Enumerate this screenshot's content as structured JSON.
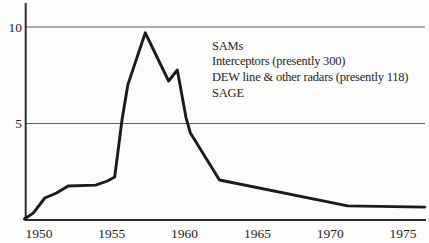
{
  "page": {
    "background": "#fcfcfa",
    "ink": "#1b1b1b",
    "grid_color": "#5f5f5f",
    "axis_color": "#2e2e2e"
  },
  "chart_data": {
    "type": "line",
    "title": "",
    "xlabel": "",
    "ylabel": "",
    "xlim": [
      1949.0,
      1976.5
    ],
    "ylim": [
      0,
      10.8
    ],
    "xticks": [
      "1950",
      "1955",
      "1960",
      "1965",
      "1970",
      "1975"
    ],
    "xtick_values": [
      1950,
      1955,
      1960,
      1965,
      1970,
      1975
    ],
    "yticks": [
      "5",
      "10"
    ],
    "ytick_values": [
      5,
      10
    ],
    "grid": "horizontal-at-yticks",
    "legend_position": "upper-right-annotation-block",
    "series": [
      {
        "name": "air-defense-systems-curve",
        "points": [
          [
            1949.0,
            0.05
          ],
          [
            1949.6,
            0.36
          ],
          [
            1950.4,
            1.14
          ],
          [
            1951.2,
            1.4
          ],
          [
            1952.0,
            1.76
          ],
          [
            1953.9,
            1.81
          ],
          [
            1954.7,
            2.02
          ],
          [
            1955.2,
            2.23
          ],
          [
            1955.7,
            5.18
          ],
          [
            1956.1,
            7.0
          ],
          [
            1957.3,
            9.7
          ],
          [
            1958.9,
            7.2
          ],
          [
            1959.5,
            7.77
          ],
          [
            1960.1,
            5.28
          ],
          [
            1960.4,
            4.51
          ],
          [
            1962.4,
            2.07
          ],
          [
            1971.2,
            0.73
          ],
          [
            1976.5,
            0.67
          ]
        ]
      }
    ],
    "annotations": {
      "lines": [
        "SAMs",
        "Interceptors (presently 300)",
        "DEW line & other radars (presently 118)",
        "SAGE"
      ]
    }
  }
}
